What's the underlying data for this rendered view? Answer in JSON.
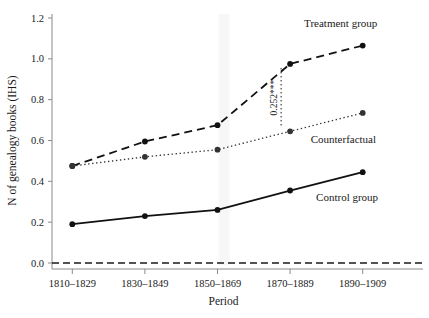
{
  "chart_data": {
    "type": "line",
    "title": "",
    "xlabel": "Period",
    "ylabel": "N of genealogy books (IHS)",
    "categories": [
      "1810–1829",
      "1830–1849",
      "1850–1869",
      "1870–1889",
      "1890–1909"
    ],
    "ylim": [
      0.0,
      1.2
    ],
    "yticks": [
      "0.0",
      "0.2",
      "0.4",
      "0.6",
      "0.8",
      "1.0",
      "1.2"
    ],
    "ytick_values": [
      0.0,
      0.2,
      0.4,
      0.6,
      0.8,
      1.0,
      1.2
    ],
    "grid": false,
    "legend_position": "inline-right",
    "series": [
      {
        "name": "Treatment group",
        "label": "Treatment group",
        "style": "dashed",
        "marker": "filled-circle",
        "color": "#111111",
        "values": [
          0.475,
          0.595,
          0.675,
          0.975,
          1.065
        ]
      },
      {
        "name": "Counterfactual",
        "label": "Counterfactual",
        "style": "dotted",
        "marker": "filled-circle",
        "color": "#333333",
        "values": [
          0.475,
          0.52,
          0.555,
          0.645,
          0.735
        ]
      },
      {
        "name": "Control group",
        "label": "Control group",
        "style": "solid",
        "marker": "filled-circle",
        "color": "#111111",
        "values": [
          0.19,
          0.23,
          0.26,
          0.355,
          0.445
        ]
      }
    ],
    "zero_line": {
      "value": 0.0,
      "style": "dashed"
    },
    "annotations": [
      {
        "text": "0.252***",
        "x_category": "1870–1889",
        "y_from": 0.645,
        "y_to": 0.975,
        "rotation": -90
      }
    ],
    "highlight_band": {
      "from_category": "1850–1869",
      "color": "#f7f7f7"
    }
  },
  "colors": {
    "axis": "#8a8a8a",
    "ink": "#1a1a1a",
    "band": "#f6f6f6"
  }
}
